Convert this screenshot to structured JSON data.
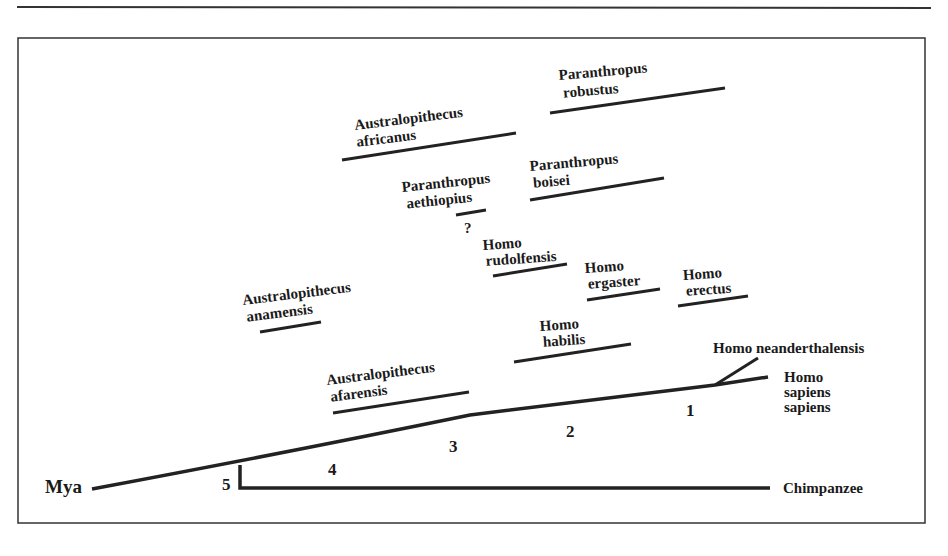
{
  "diagram": {
    "type": "phylogenetic-tree",
    "axis_label": "Mya",
    "time_marks": [
      "5",
      "4",
      "3",
      "2",
      "1"
    ],
    "outgroup": "Chimpanzee",
    "unknown_marker": "?",
    "species": [
      {
        "genus": "Paranthropus",
        "species": "robustus"
      },
      {
        "genus": "Australopithecus",
        "species": "africanus"
      },
      {
        "genus": "Paranthropus",
        "species": "boisei"
      },
      {
        "genus": "Paranthropus",
        "species": "aethiopius"
      },
      {
        "genus": "Homo",
        "species": "rudolfensis"
      },
      {
        "genus": "Homo",
        "species": "ergaster"
      },
      {
        "genus": "Homo",
        "species": "erectus"
      },
      {
        "genus": "Australopithecus",
        "species": "anamensis"
      },
      {
        "genus": "Homo",
        "species": "habilis"
      },
      {
        "genus": "Australopithecus",
        "species": "afarensis"
      }
    ],
    "terminal_labels": {
      "neanderthal": "Homo neanderthalensis",
      "sapiens": [
        "Homo",
        "sapiens",
        "sapiens"
      ]
    }
  }
}
